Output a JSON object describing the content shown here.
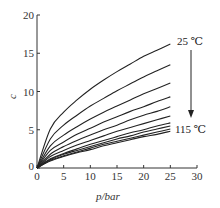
{
  "chart_data": {
    "type": "line",
    "title": "",
    "xlabel": "p/bar",
    "ylabel": "c",
    "xlim": [
      0,
      30
    ],
    "ylim": [
      0,
      20
    ],
    "xticks": [
      "0",
      "5",
      "10",
      "15",
      "20",
      "25",
      "30"
    ],
    "yticks": [
      "0",
      "5",
      "10",
      "15",
      "20"
    ],
    "grid": false,
    "legend": "none",
    "annotations": [
      {
        "text": "25 ℃",
        "position": "top end of highest curve"
      },
      {
        "text": "115 ℃",
        "position": "bottom end of lowest curves"
      },
      {
        "text": "arrow",
        "direction": "down",
        "meaning": "increasing temperature from 25 ℃ to 115 ℃"
      }
    ],
    "x": [
      0,
      2.5,
      5,
      7.5,
      10,
      12.5,
      15,
      17.5,
      20,
      22.5,
      25
    ],
    "series": [
      {
        "name": "25 ℃",
        "values": [
          0,
          5.1,
          7.3,
          8.9,
          10.3,
          11.5,
          12.6,
          13.6,
          14.6,
          15.4,
          16.2
        ]
      },
      {
        "name": "35 ℃",
        "values": [
          0,
          3.8,
          5.6,
          6.9,
          8.1,
          9.1,
          10.1,
          11.0,
          11.9,
          12.7,
          13.5
        ]
      },
      {
        "name": "45 ℃",
        "values": [
          0,
          2.9,
          4.3,
          5.4,
          6.4,
          7.3,
          8.1,
          8.9,
          9.7,
          10.4,
          11.1
        ]
      },
      {
        "name": "55 ℃",
        "values": [
          0,
          2.3,
          3.4,
          4.4,
          5.2,
          6.0,
          6.7,
          7.4,
          8.0,
          8.7,
          9.3
        ]
      },
      {
        "name": "65 ℃",
        "values": [
          0,
          1.8,
          2.8,
          3.6,
          4.3,
          5.0,
          5.6,
          6.3,
          6.9,
          7.4,
          8.0
        ]
      },
      {
        "name": "75 ℃",
        "values": [
          0,
          1.5,
          2.3,
          3.0,
          3.6,
          4.2,
          4.8,
          5.3,
          5.8,
          6.3,
          6.8
        ]
      },
      {
        "name": "85 ℃",
        "values": [
          0,
          1.2,
          1.9,
          2.5,
          3.1,
          3.6,
          4.1,
          4.6,
          5.0,
          5.5,
          5.9
        ]
      },
      {
        "name": "95 ℃",
        "values": [
          0,
          1.1,
          1.8,
          2.3,
          2.8,
          3.3,
          3.8,
          4.2,
          4.7,
          5.1,
          5.5
        ]
      },
      {
        "name": "105 ℃",
        "values": [
          0,
          1.0,
          1.6,
          2.1,
          2.6,
          3.1,
          3.5,
          3.9,
          4.3,
          4.7,
          5.1
        ]
      },
      {
        "name": "115 ℃",
        "values": [
          0,
          0.9,
          1.5,
          2.0,
          2.4,
          2.9,
          3.3,
          3.7,
          4.1,
          4.4,
          4.8
        ]
      }
    ]
  },
  "labels": {
    "top_annotation": "25 ℃",
    "bottom_annotation": "115 ℃",
    "xlabel": "p/bar",
    "ylabel": "c",
    "origin_y": "0"
  }
}
